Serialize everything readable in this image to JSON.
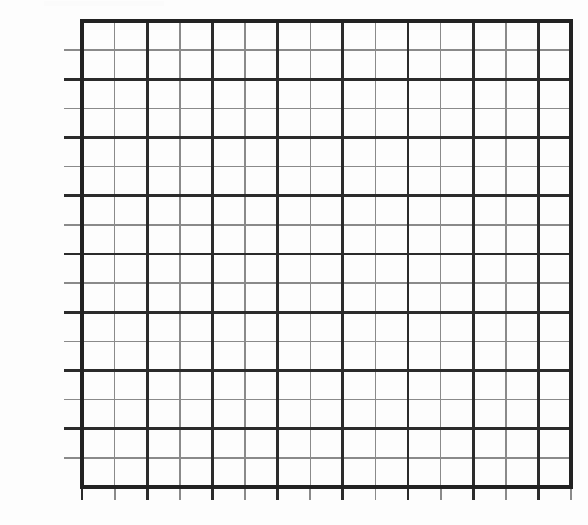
{
  "chart_data": {
    "type": "table",
    "title": "",
    "xlabel": "",
    "ylabel": "",
    "grid": true,
    "legend": null,
    "series": [],
    "values": [],
    "categories": [],
    "y_axis": {
      "unit": "degree",
      "suffix": "°",
      "min": -30,
      "max": 130,
      "step": 10,
      "tick_labels": [
        "120°",
        "110°",
        "100°",
        "90°",
        "80°",
        "70°",
        "60°",
        "50°",
        "40°",
        "30°",
        "20°",
        "10°",
        "0°",
        "-10°",
        "-20°"
      ],
      "tick_values": [
        120,
        110,
        100,
        90,
        80,
        70,
        60,
        50,
        40,
        30,
        20,
        10,
        0,
        -10,
        -20
      ],
      "major_values": [
        130,
        110,
        90,
        70,
        50,
        30,
        10,
        -10,
        -30
      ],
      "minor_values": [
        120,
        100,
        80,
        60,
        40,
        20,
        0,
        -20
      ]
    },
    "x_axis": {
      "tick_labels": [],
      "column_count": 15,
      "major_every": 2
    },
    "colors": {
      "background": "#fdfdfd",
      "major_line": "#2b2b2b",
      "minor_line": "#8a8a8a",
      "border": "#222222",
      "label_text": "#1d1d1d"
    },
    "geometry": {
      "plot_left": 82,
      "plot_right": 571,
      "plot_top": 21,
      "plot_bottom": 487,
      "row_height": 29.1,
      "col_width": 32.6,
      "y_tick_stub_length": 18,
      "x_tick_stub_length": 13
    }
  }
}
